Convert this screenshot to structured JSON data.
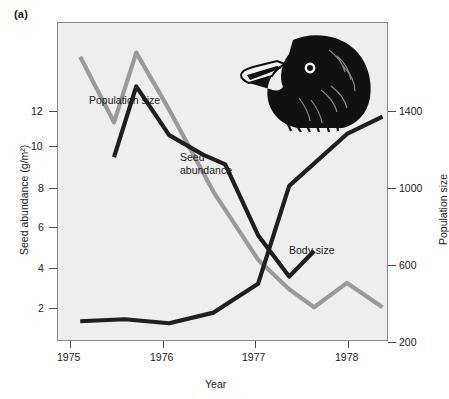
{
  "figure": {
    "panel_label": "(a)",
    "illustration": "darwins-finch-head-illustration"
  },
  "chart_data": {
    "type": "line",
    "title": "",
    "xlabel": "Year",
    "grid": false,
    "legend": "inline-annotations",
    "xlim": [
      1974.75,
      1978.45
    ],
    "xticks": [
      1975,
      1976,
      1977,
      1978
    ],
    "xtick_labels": [
      "1975",
      "1976",
      "1977",
      "1978"
    ],
    "axes": [
      {
        "id": "seed",
        "side": "left",
        "position": "outer",
        "label": "Seed abundance (g/m²)",
        "ticks": [
          2,
          4,
          6,
          8,
          10,
          12
        ],
        "tick_labels": [
          "2",
          "4",
          "6",
          "8",
          "10",
          "12"
        ],
        "lim": [
          0.2,
          13.2
        ]
      },
      {
        "id": "bodysize",
        "side": "left",
        "position": "inner",
        "label": "Body size index",
        "ticks": [
          0.02,
          0.04,
          0.06,
          0.08,
          0.1
        ],
        "tick_labels": [
          ".02",
          ".04",
          ".06",
          ".08",
          "1.0"
        ],
        "lim": [
          0.002,
          0.112
        ]
      },
      {
        "id": "population",
        "side": "right",
        "position": "outer",
        "label": "Population size",
        "ticks": [
          200,
          600,
          1000,
          1400
        ],
        "tick_labels": [
          "200",
          "600",
          "1000",
          "1400"
        ],
        "lim": [
          60,
          1560
        ]
      }
    ],
    "series": [
      {
        "name": "Population size",
        "axis": "population",
        "color": "#9a9a9a",
        "annotation": "Population size",
        "x": [
          1975.0,
          1975.38,
          1975.63,
          1976.0,
          1976.5,
          1977.0,
          1977.35,
          1977.63,
          1978.0,
          1978.4
        ],
        "values": [
          1400,
          1090,
          1420,
          1150,
          760,
          440,
          300,
          215,
          330,
          215
        ]
      },
      {
        "name": "Seed abundance",
        "axis": "seed",
        "color": "#1f1f1f",
        "annotation": "Seed abundance",
        "x": [
          1975.38,
          1975.63,
          1976.0,
          1976.38,
          1976.63,
          1977.0,
          1977.35,
          1977.63
        ],
        "values": [
          7.7,
          10.6,
          8.6,
          7.8,
          7.4,
          4.5,
          2.8,
          3.85
        ]
      },
      {
        "name": "Body size",
        "axis": "bodysize",
        "color": "#1f1f1f",
        "annotation": "Body size",
        "x": [
          1975.0,
          1975.5,
          1976.0,
          1976.5,
          1977.0,
          1977.35,
          1978.0,
          1978.4
        ],
        "values": [
          0.0085,
          0.0092,
          0.0078,
          0.0115,
          0.0215,
          0.0555,
          0.0735,
          0.0795
        ]
      }
    ]
  }
}
